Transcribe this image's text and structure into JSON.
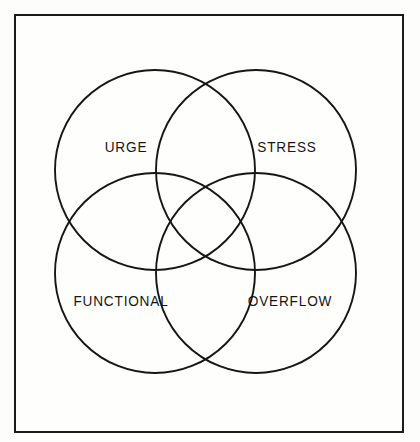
{
  "figure": {
    "kind": "venn-diagram",
    "frame": {
      "border_color": "#1b1b1b",
      "background_color": "#fefefd"
    },
    "stroke_color": "#161616",
    "fill": "none",
    "circle_count": 4
  },
  "diagram_data": {
    "type": "venn",
    "sets": [
      {
        "id": "urge",
        "label": "URGE",
        "cx": 155,
        "cy": 170,
        "r": 100,
        "label_x": 126,
        "label_y": 147
      },
      {
        "id": "stress",
        "label": "STRESS",
        "cx": 256,
        "cy": 170,
        "r": 100,
        "label_x": 287,
        "label_y": 147
      },
      {
        "id": "functional",
        "label": "FUNCTIONAL",
        "cx": 155,
        "cy": 273,
        "r": 100,
        "label_x": 121,
        "label_y": 301
      },
      {
        "id": "overflow",
        "label": "OVERFLOW",
        "cx": 256,
        "cy": 273,
        "r": 100,
        "label_x": 290,
        "label_y": 301
      }
    ]
  },
  "labels": {
    "top_left": "URGE",
    "top_right": "STRESS",
    "bottom_left": "FUNCTIONAL",
    "bottom_right": "OVERFLOW"
  }
}
